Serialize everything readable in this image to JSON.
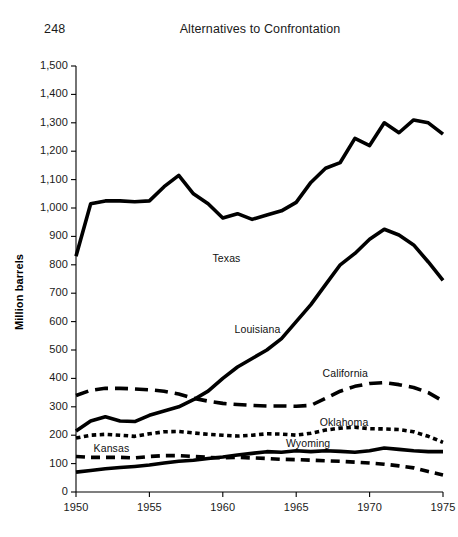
{
  "page": {
    "folio": "248",
    "running_title": "Alternatives to Confrontation"
  },
  "chart_data": {
    "type": "line",
    "title": "",
    "xlabel": "",
    "ylabel": "Million barrels",
    "xlim": [
      1950,
      1975
    ],
    "ylim": [
      0,
      1500
    ],
    "xticks": [
      1950,
      1955,
      1960,
      1965,
      1970,
      1975
    ],
    "xtick_labels": [
      "1950",
      "1955",
      "1960",
      "1965",
      "1970",
      "1975"
    ],
    "yticks": [
      0,
      100,
      200,
      300,
      400,
      500,
      600,
      700,
      800,
      900,
      1000,
      1100,
      1200,
      1300,
      1400,
      1500
    ],
    "ytick_labels": [
      "0",
      "100",
      "200",
      "300",
      "400",
      "500",
      "600",
      "700",
      "800",
      "900",
      "1,000",
      "1,100",
      "1,200",
      "1,300",
      "1,400",
      "1,500"
    ],
    "grid": false,
    "legend": "inline-labels",
    "x": [
      1950,
      1951,
      1952,
      1953,
      1954,
      1955,
      1956,
      1957,
      1958,
      1959,
      1960,
      1961,
      1962,
      1963,
      1964,
      1965,
      1966,
      1967,
      1968,
      1969,
      1970,
      1971,
      1972,
      1973,
      1974,
      1975
    ],
    "series": [
      {
        "name": "Texas",
        "style": "solid",
        "label_x": 1959.3,
        "label_y": 820,
        "values": [
          830,
          1015,
          1025,
          1025,
          1022,
          1025,
          1075,
          1115,
          1050,
          1015,
          965,
          980,
          960,
          975,
          990,
          1020,
          1090,
          1140,
          1160,
          1245,
          1220,
          1300,
          1265,
          1310,
          1300,
          1260
        ]
      },
      {
        "name": "Louisiana",
        "style": "solid",
        "label_x": 1960.8,
        "label_y": 570,
        "values": [
          215,
          250,
          265,
          250,
          248,
          270,
          285,
          300,
          325,
          355,
          400,
          440,
          470,
          500,
          540,
          600,
          660,
          730,
          800,
          840,
          890,
          925,
          905,
          870,
          810,
          745
        ]
      },
      {
        "name": "California",
        "style": "long-dash",
        "label_x": 1966.8,
        "label_y": 415,
        "values": [
          340,
          358,
          365,
          365,
          363,
          360,
          355,
          345,
          330,
          320,
          312,
          308,
          305,
          303,
          303,
          302,
          305,
          330,
          355,
          372,
          382,
          385,
          378,
          368,
          350,
          320
        ]
      },
      {
        "name": "Oklahoma",
        "style": "short-dash",
        "label_x": 1966.6,
        "label_y": 243,
        "values": [
          190,
          200,
          203,
          200,
          196,
          205,
          212,
          213,
          208,
          203,
          200,
          197,
          200,
          205,
          204,
          200,
          207,
          218,
          225,
          228,
          223,
          222,
          220,
          212,
          196,
          175
        ]
      },
      {
        "name": "Wyoming",
        "style": "solid",
        "label_x": 1964.3,
        "label_y": 168,
        "values": [
          70,
          76,
          82,
          86,
          90,
          95,
          102,
          108,
          112,
          118,
          123,
          130,
          136,
          142,
          140,
          145,
          142,
          145,
          143,
          140,
          145,
          155,
          150,
          145,
          142,
          142
        ]
      },
      {
        "name": "Kansas",
        "style": "medium-dash",
        "label_x": 1951.2,
        "label_y": 152,
        "values": [
          125,
          122,
          122,
          122,
          120,
          125,
          128,
          128,
          125,
          122,
          120,
          122,
          120,
          118,
          115,
          114,
          112,
          110,
          108,
          105,
          102,
          98,
          92,
          85,
          72,
          60
        ]
      }
    ]
  }
}
